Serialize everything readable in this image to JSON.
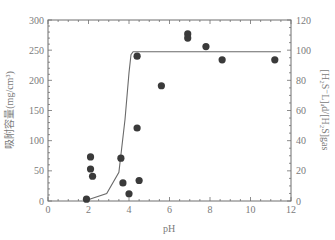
{
  "chart_data": {
    "type": "scatter",
    "title": "",
    "xlabel": "pH",
    "ylabel": "吸附容量(mg/cm³)",
    "y2label": "[H₂S⁻L]ₐd/[H₂S]gas",
    "xlim": [
      0,
      12
    ],
    "ylim": [
      0,
      300
    ],
    "y2lim": [
      0,
      120
    ],
    "grid": false,
    "legend": null,
    "x_ticks": [
      0,
      2,
      4,
      6,
      8,
      10,
      12
    ],
    "y_ticks": [
      0,
      50,
      100,
      150,
      200,
      250,
      300
    ],
    "y2_ticks": [
      0,
      20,
      40,
      60,
      80,
      100,
      120
    ],
    "series": [
      {
        "name": "adsorption capacity",
        "kind": "scatter",
        "axis": "left",
        "color": "#3a3a3a",
        "points": [
          {
            "x": 1.9,
            "y": 3
          },
          {
            "x": 2.1,
            "y": 73
          },
          {
            "x": 2.1,
            "y": 53
          },
          {
            "x": 2.2,
            "y": 41
          },
          {
            "x": 3.6,
            "y": 71
          },
          {
            "x": 3.7,
            "y": 30
          },
          {
            "x": 4.0,
            "y": 12
          },
          {
            "x": 4.4,
            "y": 240
          },
          {
            "x": 4.4,
            "y": 121
          },
          {
            "x": 4.5,
            "y": 34
          },
          {
            "x": 5.6,
            "y": 191
          },
          {
            "x": 6.9,
            "y": 277
          },
          {
            "x": 6.9,
            "y": 270
          },
          {
            "x": 7.8,
            "y": 256
          },
          {
            "x": 8.6,
            "y": 234
          },
          {
            "x": 11.2,
            "y": 234
          }
        ]
      },
      {
        "name": "[H2S-L]ad/[H2S]gas model",
        "kind": "line",
        "axis": "right",
        "color": "#6a6a6a",
        "points": [
          {
            "x": 1.9,
            "y": 0.5
          },
          {
            "x": 2.9,
            "y": 5
          },
          {
            "x": 3.5,
            "y": 19
          },
          {
            "x": 3.8,
            "y": 54
          },
          {
            "x": 4.0,
            "y": 85
          },
          {
            "x": 4.1,
            "y": 97
          },
          {
            "x": 4.2,
            "y": 99
          },
          {
            "x": 11.5,
            "y": 99
          }
        ]
      }
    ]
  }
}
